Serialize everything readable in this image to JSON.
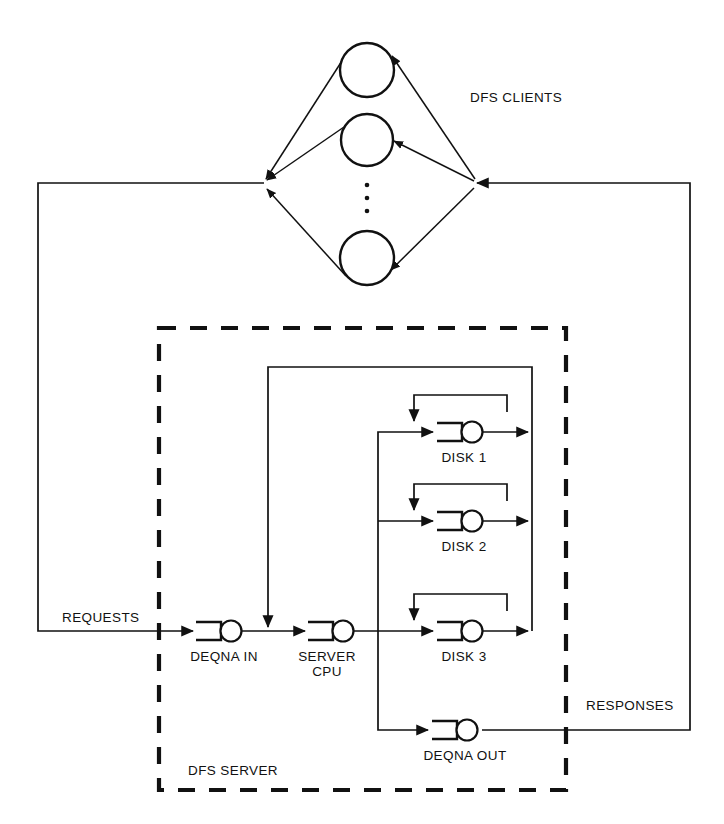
{
  "diagram": {
    "labels": {
      "clients": "DFS CLIENTS",
      "requests": "REQUESTS",
      "responses": "RESPONSES",
      "server_box": "DFS SERVER",
      "deqna_in": "DEQNA IN",
      "server_cpu_line1": "SERVER",
      "server_cpu_line2": "CPU",
      "disk1": "DISK 1",
      "disk2": "DISK 2",
      "disk3": "DISK 3",
      "deqna_out": "DEQNA OUT"
    },
    "colors": {
      "line": "#111111",
      "background": "#ffffff",
      "text": "#111111"
    },
    "clients": {
      "count_shown": 3,
      "ellipsis": "⋮",
      "radius": 27,
      "centers": [
        {
          "x": 367,
          "y": 70
        },
        {
          "x": 367,
          "y": 140
        },
        {
          "x": 367,
          "y": 258
        }
      ]
    },
    "service_centers": [
      {
        "id": "deqna-in",
        "label": "DEQNA IN",
        "cx": 231,
        "cy": 631
      },
      {
        "id": "server-cpu",
        "label": "SERVER CPU",
        "cx": 343,
        "cy": 631
      },
      {
        "id": "disk-1",
        "label": "DISK 1",
        "cx": 472,
        "cy": 432
      },
      {
        "id": "disk-2",
        "label": "DISK 2",
        "cx": 472,
        "cy": 521
      },
      {
        "id": "disk-3",
        "label": "DISK 3",
        "cx": 472,
        "cy": 631
      },
      {
        "id": "deqna-out",
        "label": "DEQNA OUT",
        "cx": 467,
        "cy": 730
      }
    ]
  }
}
